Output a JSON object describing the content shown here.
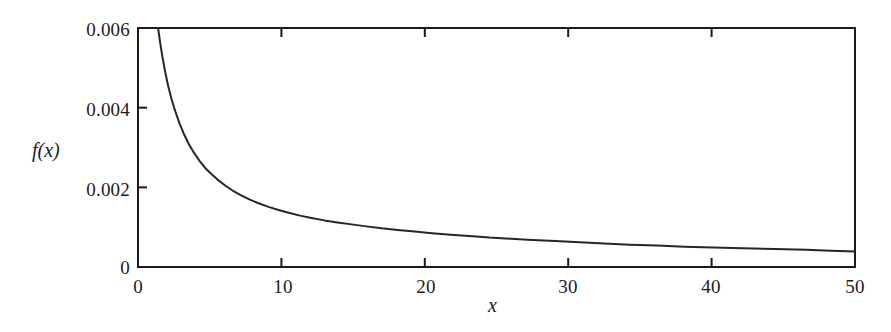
{
  "chart_data": {
    "type": "line",
    "title": "",
    "subtitle": "",
    "xlabel": "x",
    "ylabel": "f(x)",
    "xlim": [
      0,
      50
    ],
    "ylim": [
      0,
      0.006
    ],
    "grid": false,
    "legend": "none",
    "x_ticks": [
      0,
      10,
      20,
      30,
      40,
      50
    ],
    "x_tick_labels": [
      "0",
      "10",
      "20",
      "30",
      "40",
      "50"
    ],
    "y_ticks": [
      0,
      0.002,
      0.004,
      0.006
    ],
    "y_tick_labels": [
      "0",
      "0.002",
      "0.004",
      "0.006"
    ],
    "series": [
      {
        "name": "f(x)",
        "color": "#262626",
        "x": [
          1.4,
          1.55,
          1.7,
          1.9,
          2.1,
          2.35,
          2.6,
          2.9,
          3.2,
          3.55,
          3.9,
          4.3,
          4.7,
          5.1,
          5.6,
          6.1,
          6.6,
          7.2,
          7.8,
          8.4,
          9.1,
          9.8,
          10.5,
          11.3,
          12.1,
          13.0,
          13.9,
          14.9,
          15.9,
          17.0,
          18.1,
          19.3,
          20.5,
          21.8,
          23.1,
          24.5,
          26.0,
          27.5,
          29.1,
          30.8,
          32.5,
          34.3,
          36.2,
          38.1,
          40.1,
          42.2,
          44.4,
          46.6,
          48.3,
          50.0
        ],
        "y": [
          0.006,
          0.00562,
          0.00528,
          0.00489,
          0.00455,
          0.0042,
          0.00391,
          0.0036,
          0.00334,
          0.00308,
          0.00287,
          0.00266,
          0.00248,
          0.00234,
          0.00218,
          0.00204,
          0.00192,
          0.0018,
          0.00169,
          0.0016,
          0.00151,
          0.00143,
          0.00136,
          0.00129,
          0.00123,
          0.00117,
          0.00112,
          0.00107,
          0.00102,
          0.00097,
          0.00093,
          0.00089,
          0.00085,
          0.00081,
          0.00078,
          0.00074,
          0.00071,
          0.00068,
          0.00065,
          0.00062,
          0.00059,
          0.00056,
          0.00054,
          0.00051,
          0.00049,
          0.00047,
          0.00045,
          0.00043,
          0.00041,
          0.00039
        ]
      }
    ],
    "axes": {
      "box": true,
      "tick_direction": "in",
      "line_color": "#1a1a1a",
      "line_width": 2
    }
  }
}
